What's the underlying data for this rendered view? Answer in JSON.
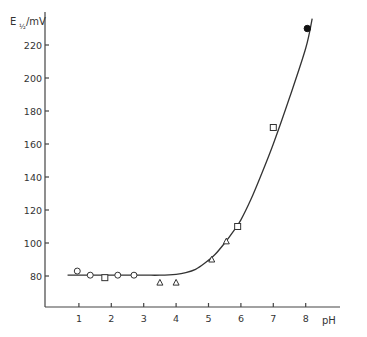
{
  "chart_data": {
    "type": "line",
    "title": "",
    "xlabel": "pH",
    "ylabel": "E½/mV",
    "ylabel_main": "E",
    "ylabel_sub": "½",
    "ylabel_unit": "/mV",
    "xlim": [
      0,
      9
    ],
    "ylim": [
      60,
      240
    ],
    "grid": false,
    "legend": null,
    "x_ticks": [
      1,
      2,
      3,
      4,
      5,
      6,
      7,
      8
    ],
    "y_ticks": [
      80,
      100,
      120,
      140,
      160,
      180,
      200,
      220
    ],
    "fitted_curve": {
      "name": "fit",
      "x": [
        0.65,
        1,
        2,
        3,
        3.5,
        4.0,
        4.3,
        4.6,
        4.9,
        5.2,
        5.5,
        5.8,
        6.0,
        6.3,
        6.6,
        7.0,
        7.5,
        8.0,
        8.2
      ],
      "y": [
        80.5,
        80.5,
        80.5,
        80.5,
        80.5,
        81,
        82,
        84,
        88,
        93,
        100,
        108,
        114,
        126,
        140,
        160,
        188,
        218,
        236
      ]
    },
    "series": [
      {
        "name": "open-circles",
        "marker": "circle-open",
        "x": [
          0.95,
          1.35,
          2.2,
          2.7
        ],
        "y": [
          83,
          80.5,
          80.5,
          80.5
        ]
      },
      {
        "name": "open-squares",
        "marker": "square-open",
        "x": [
          1.8,
          5.9,
          7.0
        ],
        "y": [
          79,
          110,
          170
        ]
      },
      {
        "name": "open-triangles",
        "marker": "triangle-open",
        "x": [
          3.5,
          4.0,
          5.1,
          5.55
        ],
        "y": [
          76,
          76,
          90,
          101
        ]
      },
      {
        "name": "filled-circles",
        "marker": "circle-filled",
        "x": [
          8.05
        ],
        "y": [
          230
        ]
      }
    ]
  }
}
